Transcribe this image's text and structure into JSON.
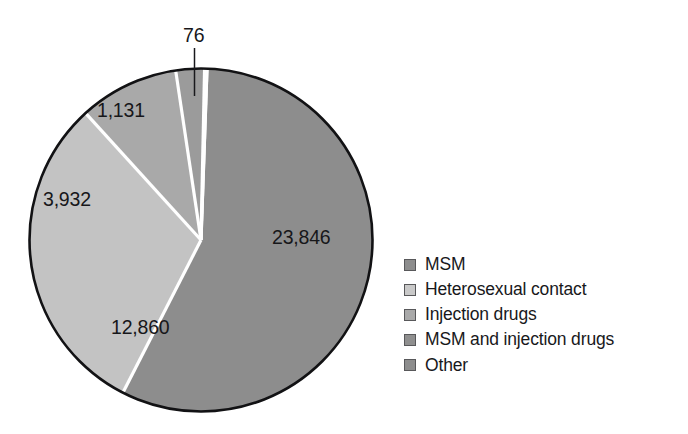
{
  "chart_data": {
    "type": "pie",
    "title": "",
    "subtitle": "",
    "xlabel": "",
    "ylabel": "",
    "grid": false,
    "legend_position": "right",
    "total": 41845,
    "categories": [
      "MSM",
      "Heterosexual contact",
      "Injection drugs",
      "MSM and injection drugs",
      "Other"
    ],
    "values": [
      23846,
      12860,
      3932,
      1131,
      76
    ],
    "value_labels": [
      "23,846",
      "12,860",
      "3,932",
      "1,131",
      "76"
    ],
    "colors": [
      "#8d8d8d",
      "#c3c3c3",
      "#a9a9a9",
      "#9b9b9b",
      "#8d8d8d"
    ],
    "slices": [
      {
        "name": "MSM",
        "value": 23846,
        "label": "23,846",
        "color": "#8d8d8d",
        "start_angle": 2.0,
        "end_angle": 207.1
      },
      {
        "name": "Heterosexual contact",
        "value": 12860,
        "label": "12,860",
        "color": "#c3c3c3",
        "start_angle": 207.1,
        "end_angle": 317.7
      },
      {
        "name": "Injection drugs",
        "value": 3932,
        "label": "3,932",
        "color": "#a9a9a9",
        "start_angle": 317.7,
        "end_angle": 351.5
      },
      {
        "name": "MSM and injection drugs",
        "value": 1131,
        "label": "1,131",
        "color": "#9b9b9b",
        "start_angle": 351.5,
        "end_angle": 361.2
      },
      {
        "name": "Other",
        "value": 76,
        "label": "76",
        "color": "#8d8d8d",
        "start_angle": 361.2,
        "end_angle": 362.0
      }
    ]
  },
  "legend": {
    "items": [
      {
        "label": "MSM",
        "swatch_color": "#8d8d8d"
      },
      {
        "label": "Heterosexual contact",
        "swatch_color": "#c9c9c9"
      },
      {
        "label": "Injection drugs",
        "swatch_color": "#a9a9a9"
      },
      {
        "label": "MSM and injection drugs",
        "swatch_color": "#8f8f8f"
      },
      {
        "label": "Other",
        "swatch_color": "#8d8d8d"
      }
    ]
  },
  "style": {
    "outline_color": "#121214",
    "divider_color": "#ffffff",
    "text_color": "#17171a",
    "background": "#ffffff"
  }
}
